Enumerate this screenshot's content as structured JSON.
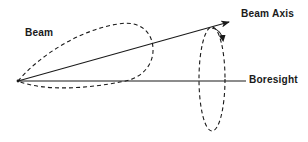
{
  "diagram": {
    "labels": {
      "beam": "Beam",
      "beam_axis": "Beam Axis",
      "boresight": "Boresight"
    },
    "colors": {
      "stroke": "#1a1a1a",
      "background": "#ffffff"
    },
    "elements": [
      {
        "id": "beam-lobe",
        "type": "dashed-teardrop",
        "description": "Antenna beam pattern lobe originating at the apex"
      },
      {
        "id": "beam-axis",
        "type": "arrow",
        "description": "Beam axis tilted upward from apex"
      },
      {
        "id": "boresight",
        "type": "line",
        "description": "Horizontal boresight reference line"
      },
      {
        "id": "scan-ellipse",
        "type": "dashed-ellipse-with-arrow",
        "description": "Conical scan rotation path of beam axis around boresight"
      }
    ]
  }
}
